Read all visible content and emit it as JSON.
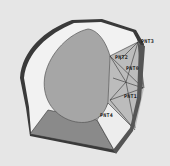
{
  "diagram": {
    "type": "3d-cad-part-view",
    "colors": {
      "background": "#e6e6e6",
      "outer_rim": "#3a3a3a",
      "rim_highlight": "#9a9a9a",
      "inner_face": "#f2f2f2",
      "dome": "#a6a6a6",
      "dome_outline": "#555555",
      "bottom_face": "#8a8a8a",
      "mesh_faces": "#b8b8b8",
      "mesh_lines": "#333333",
      "light_face": "#ededed"
    },
    "labels": [
      {
        "id": "pnt3",
        "text": "PNT3",
        "x": 141,
        "y": 39
      },
      {
        "id": "pnt2",
        "text": "PNT2",
        "x": 115,
        "y": 55
      },
      {
        "id": "pnt0",
        "text": "PNT0",
        "x": 126,
        "y": 66
      },
      {
        "id": "pnt1",
        "text": "PNT1",
        "x": 124,
        "y": 94
      },
      {
        "id": "pnt4",
        "text": "PNT4",
        "x": 100,
        "y": 113
      }
    ]
  }
}
